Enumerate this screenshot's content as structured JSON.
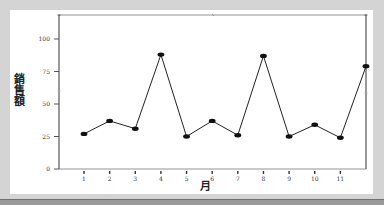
{
  "chart_data": {
    "type": "line",
    "title": "",
    "xlabel": "月",
    "ylabel": "銷售額",
    "categories": [
      "1",
      "2",
      "3",
      "4",
      "5",
      "6",
      "7",
      "8",
      "9",
      "10",
      "11",
      "12"
    ],
    "x_tick_labels": [
      "1",
      "2",
      "3",
      "4",
      "5",
      "6",
      "7",
      "8",
      "9",
      "10",
      "11"
    ],
    "values": [
      27,
      37,
      31,
      88,
      25,
      37,
      26,
      87,
      25,
      34,
      24,
      79
    ],
    "series": [
      {
        "name": "銷售額",
        "values": [
          27,
          37,
          31,
          88,
          25,
          37,
          26,
          87,
          25,
          34,
          24,
          79
        ]
      }
    ],
    "y_ticks": [
      0,
      25,
      50,
      75,
      100
    ],
    "ylim": [
      0,
      120
    ],
    "grid": false,
    "legend": "none",
    "marker": "filled-ellipse",
    "line_color": "#222222",
    "background": "#ffffff",
    "frame_color": "#d4d4d4"
  }
}
